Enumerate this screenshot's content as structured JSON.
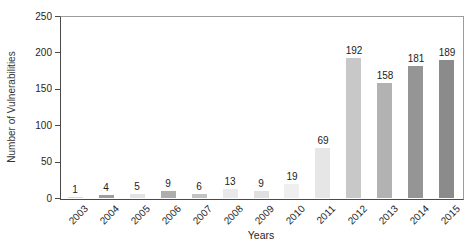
{
  "chart_data": {
    "type": "bar",
    "title": "",
    "xlabel": "Years",
    "ylabel": "Number of Vulnerabilities",
    "categories": [
      "2003",
      "2004",
      "2005",
      "2006",
      "2007",
      "2008",
      "2009",
      "2010",
      "2011",
      "2012",
      "2013",
      "2014",
      "2015"
    ],
    "values": [
      1,
      4,
      5,
      9,
      6,
      13,
      9,
      19,
      69,
      192,
      158,
      181,
      189
    ],
    "bar_colors": [
      "#d9d9d9",
      "#9e9e9e",
      "#e3e3e3",
      "#aeaeae",
      "#c3c3c3",
      "#e9e9e9",
      "#e0e0e0",
      "#efefef",
      "#e6e6e6",
      "#c8c8c8",
      "#b2b2b2",
      "#959595",
      "#8b8b8b"
    ],
    "ylim": [
      0,
      250
    ],
    "yticks": [
      0,
      50,
      100,
      150,
      200,
      250
    ],
    "grid": false,
    "value_labels": true,
    "legend": "none"
  },
  "colors": {
    "axis_left_bottom": "#4a4a4a",
    "frame_top_right": "#9c9c9c",
    "text": "#262626",
    "background": "#ffffff"
  }
}
